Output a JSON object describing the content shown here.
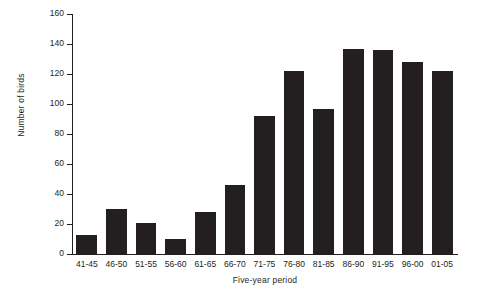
{
  "chart_data": {
    "type": "bar",
    "title": "",
    "xlabel": "Five-year period",
    "ylabel": "Number of birds",
    "categories": [
      "41-45",
      "46-50",
      "51-55",
      "56-60",
      "61-65",
      "66-70",
      "71-75",
      "76-80",
      "81-85",
      "86-90",
      "91-95",
      "96-00",
      "01-05"
    ],
    "values": [
      13,
      30,
      21,
      10,
      28,
      46,
      92,
      122,
      97,
      137,
      136,
      128,
      122
    ],
    "ylim": [
      0,
      160
    ],
    "yticks": [
      0,
      20,
      40,
      60,
      80,
      100,
      120,
      140,
      160
    ],
    "ytick_labels": [
      "0",
      "20",
      "40",
      "60",
      "80",
      "100",
      "120",
      "140",
      "160"
    ],
    "grid": false,
    "legend": "none",
    "bar_color": "#231f20",
    "axis_color": "#231f20",
    "background_color": "#ffffff"
  }
}
